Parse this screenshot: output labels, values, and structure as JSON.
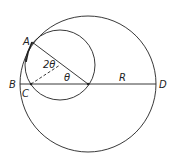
{
  "diagram": {
    "labels": {
      "A": "A",
      "B": "B",
      "C": "C",
      "D": "D",
      "R": "R",
      "angle_center": "θ",
      "angle_double": "2θ"
    },
    "colors": {
      "stroke": "#222222",
      "background": "#ffffff"
    }
  }
}
